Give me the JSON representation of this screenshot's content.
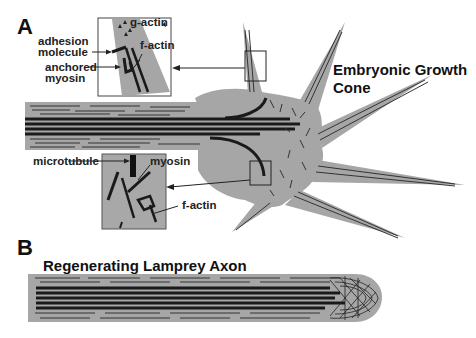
{
  "panels": {
    "a": {
      "letter": "A",
      "title_line1": "Embryonic Growth",
      "title_line2": "Cone",
      "inset_top": {
        "labels": {
          "g_actin": "g-actin",
          "adhesion_line1": "adhesion",
          "adhesion_line2": "molecule",
          "f_actin": "f-actin",
          "anchored_line1": "anchored",
          "anchored_line2": "myosin"
        }
      },
      "inset_bottom": {
        "labels": {
          "microtubule": "microtubule",
          "myosin": "myosin",
          "f_actin": "f-actin"
        }
      }
    },
    "b": {
      "letter": "B",
      "title": "Regenerating Lamprey Axon"
    }
  },
  "colors": {
    "cytoplasm": "#a6a6a6",
    "filament": "#1a1a1a",
    "inset_bg": "#b0b0b0",
    "background": "#ffffff"
  }
}
